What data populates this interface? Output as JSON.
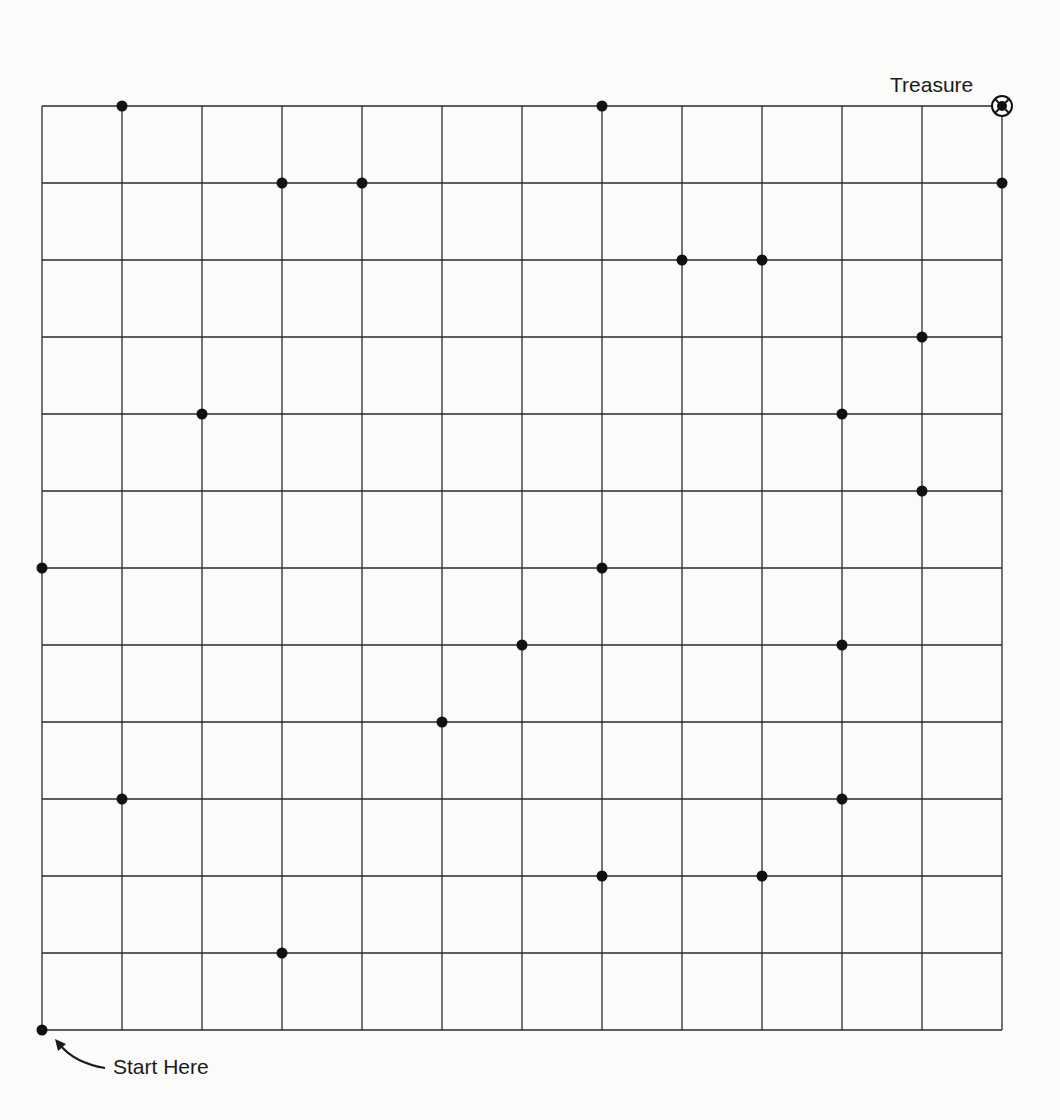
{
  "diagram": {
    "labels": {
      "treasure": "Treasure",
      "start": "Start Here"
    },
    "colors": {
      "background": "#fbfbfa",
      "grid_line": "#2a2a2a",
      "dot": "#111111"
    },
    "grid": {
      "columns": 12,
      "rows": 12,
      "origin_x": 42,
      "origin_y": 106,
      "cell_width": 80,
      "cell_height": 77
    },
    "start": {
      "col": 0,
      "row": 12
    },
    "treasure": {
      "col": 12,
      "row": 0
    },
    "dots": [
      {
        "col": 1,
        "row": 0
      },
      {
        "col": 7,
        "row": 0
      },
      {
        "col": 3,
        "row": 1
      },
      {
        "col": 4,
        "row": 1
      },
      {
        "col": 12,
        "row": 1
      },
      {
        "col": 8,
        "row": 2
      },
      {
        "col": 9,
        "row": 2
      },
      {
        "col": 11,
        "row": 3
      },
      {
        "col": 2,
        "row": 4
      },
      {
        "col": 10,
        "row": 4
      },
      {
        "col": 11,
        "row": 5
      },
      {
        "col": 0,
        "row": 6
      },
      {
        "col": 7,
        "row": 6
      },
      {
        "col": 6,
        "row": 7
      },
      {
        "col": 10,
        "row": 7
      },
      {
        "col": 5,
        "row": 8
      },
      {
        "col": 1,
        "row": 9
      },
      {
        "col": 10,
        "row": 9
      },
      {
        "col": 7,
        "row": 10
      },
      {
        "col": 9,
        "row": 10
      },
      {
        "col": 3,
        "row": 11
      },
      {
        "col": 0,
        "row": 12
      }
    ],
    "icons": {
      "treasure_marker": "target-circle-icon",
      "start_arrow": "curved-arrow-icon"
    }
  }
}
